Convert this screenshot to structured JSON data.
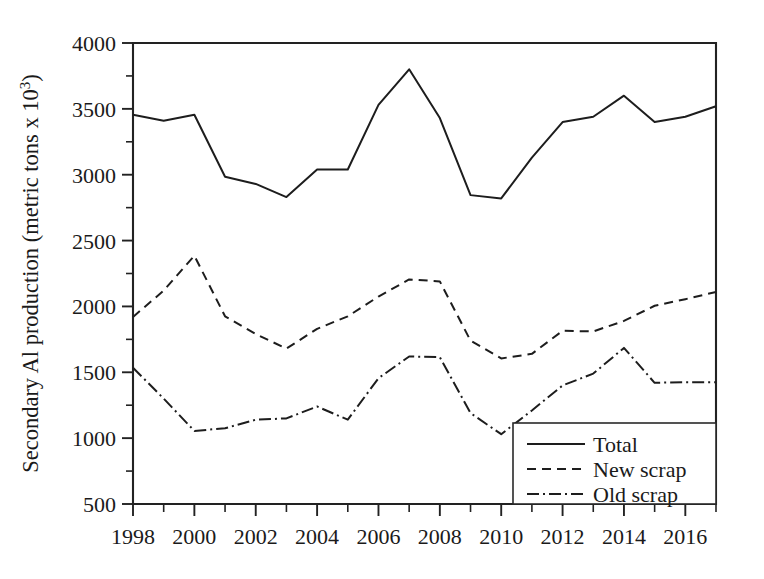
{
  "chart_data": {
    "type": "line",
    "title": "",
    "xlabel": "",
    "ylabel": "Secondary Al production (metric tons x 10",
    "ylabel_exponent": "3",
    "ylabel_close": ")",
    "x": [
      1998,
      1999,
      2000,
      2001,
      2002,
      2003,
      2004,
      2005,
      2006,
      2007,
      2008,
      2009,
      2010,
      2011,
      2012,
      2013,
      2014,
      2015,
      2016,
      2017
    ],
    "xlim": [
      1998,
      2017
    ],
    "ylim": [
      500,
      4000
    ],
    "grid": false,
    "legend_position": "bottom-right",
    "x_major_ticks": [
      1998,
      2000,
      2002,
      2004,
      2006,
      2008,
      2010,
      2012,
      2014,
      2016
    ],
    "x_major_tick_labels": [
      "1998",
      "2000",
      "2002",
      "2004",
      "2006",
      "2008",
      "2010",
      "2012",
      "2014",
      "2016"
    ],
    "x_minor_ticks": [
      1999,
      2001,
      2003,
      2005,
      2007,
      2009,
      2011,
      2013,
      2015,
      2017
    ],
    "y_major_ticks": [
      500,
      1000,
      1500,
      2000,
      2500,
      3000,
      3500,
      4000
    ],
    "y_major_tick_labels": [
      "500",
      "1000",
      "1500",
      "2000",
      "2500",
      "3000",
      "3500",
      "4000"
    ],
    "y_minor_ticks": [
      750,
      1250,
      1750,
      2250,
      2750,
      3250,
      3750
    ],
    "series": [
      {
        "name": "Total",
        "style": "solid",
        "values": [
          3455,
          3410,
          3455,
          2985,
          2930,
          2830,
          3040,
          3040,
          3530,
          3800,
          3430,
          2845,
          2820,
          3130,
          3400,
          3440,
          3600,
          3400,
          3440,
          3520
        ]
      },
      {
        "name": "New scrap",
        "style": "dashed",
        "values": [
          1920,
          2120,
          2385,
          1925,
          1790,
          1680,
          1830,
          1925,
          2075,
          2205,
          2190,
          1740,
          1605,
          1640,
          1815,
          1810,
          1890,
          2005,
          2055,
          2110
        ]
      },
      {
        "name": "Old scrap",
        "style": "dashdot",
        "values": [
          1535,
          1300,
          1055,
          1075,
          1140,
          1150,
          1240,
          1140,
          1455,
          1620,
          1615,
          1190,
          1030,
          1210,
          1400,
          1490,
          1685,
          1420,
          1425,
          1425
        ]
      }
    ]
  },
  "legend": {
    "items": [
      {
        "label": "Total",
        "style": "solid"
      },
      {
        "label": "New scrap",
        "style": "dashed"
      },
      {
        "label": "Old scrap",
        "style": "dashdot"
      }
    ]
  },
  "colors": {
    "line": "#1d1d1d",
    "axis": "#222222",
    "background": "#ffffff",
    "text": "#1a1a1a"
  }
}
